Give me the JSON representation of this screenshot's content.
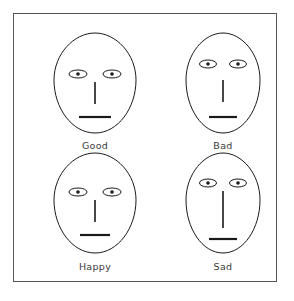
{
  "figure": {
    "title": "",
    "frame": {
      "border_color": "#555555",
      "background_color": "#ffffff"
    },
    "ink_color": "#1a1a1a",
    "label_color": "#3a3a3a",
    "layout": {
      "rows": 2,
      "columns": 2,
      "description": "2x2 grid of schematic line-drawing faces"
    }
  },
  "faces": [
    {
      "id": "good",
      "label": "Good",
      "position": {
        "row": 1,
        "column": 1
      },
      "head": {
        "width": 82,
        "height": 104,
        "shape": "egg-oval"
      },
      "eyes": {
        "y": 46,
        "spacing": 34,
        "ellipse_rx": 9,
        "ellipse_ry": 4,
        "pupil_r": 1.8
      },
      "nose": {
        "top": 54,
        "bottom": 76,
        "length": 22,
        "thickness": 1.6
      },
      "mouth": {
        "y": 89,
        "width": 32,
        "thickness": 2.2
      }
    },
    {
      "id": "bad",
      "label": "Bad",
      "position": {
        "row": 1,
        "column": 2
      },
      "head": {
        "width": 74,
        "height": 104,
        "shape": "egg-oval"
      },
      "eyes": {
        "y": 36,
        "spacing": 30,
        "ellipse_rx": 8.5,
        "ellipse_ry": 4,
        "pupil_r": 1.8
      },
      "nose": {
        "top": 52,
        "bottom": 74,
        "length": 22,
        "thickness": 1.6
      },
      "mouth": {
        "y": 89,
        "width": 28,
        "thickness": 2.2
      }
    },
    {
      "id": "happy",
      "label": "Happy",
      "position": {
        "row": 2,
        "column": 1
      },
      "head": {
        "width": 82,
        "height": 104,
        "shape": "egg-oval"
      },
      "eyes": {
        "y": 44,
        "spacing": 34,
        "ellipse_rx": 9,
        "ellipse_ry": 4,
        "pupil_r": 1.8
      },
      "nose": {
        "top": 52,
        "bottom": 74,
        "length": 22,
        "thickness": 1.6
      },
      "mouth": {
        "y": 87,
        "width": 30,
        "thickness": 2.2
      }
    },
    {
      "id": "sad",
      "label": "Sad",
      "position": {
        "row": 2,
        "column": 2
      },
      "head": {
        "width": 74,
        "height": 104,
        "shape": "egg-oval"
      },
      "eyes": {
        "y": 35,
        "spacing": 30,
        "ellipse_rx": 8.5,
        "ellipse_ry": 4,
        "pupil_r": 1.8
      },
      "nose": {
        "top": 43,
        "bottom": 80,
        "length": 37,
        "thickness": 1.6
      },
      "mouth": {
        "y": 91,
        "width": 28,
        "thickness": 2.2
      }
    }
  ]
}
